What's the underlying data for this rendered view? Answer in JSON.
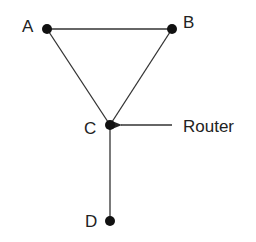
{
  "diagram": {
    "type": "network-topology",
    "nodes": [
      {
        "id": "A",
        "label": "A",
        "x": 47,
        "y": 29
      },
      {
        "id": "B",
        "label": "B",
        "x": 172,
        "y": 29
      },
      {
        "id": "C",
        "label": "C",
        "x": 110,
        "y": 125
      },
      {
        "id": "D",
        "label": "D",
        "x": 110,
        "y": 221
      }
    ],
    "edges": [
      {
        "from": "A",
        "to": "B"
      },
      {
        "from": "A",
        "to": "C"
      },
      {
        "from": "B",
        "to": "C"
      },
      {
        "from": "C",
        "to": "D"
      }
    ],
    "annotation": {
      "label": "Router",
      "points_to": "C"
    },
    "colors": {
      "node": "#111111",
      "edge": "#333333",
      "text": "#222222"
    }
  }
}
